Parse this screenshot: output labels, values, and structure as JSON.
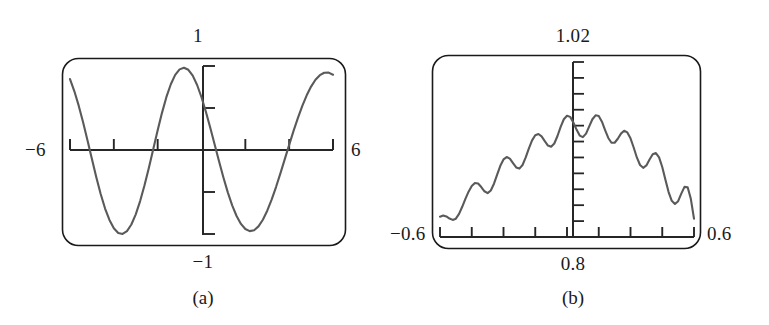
{
  "figure": {
    "kind": "graphing-calculator-screens",
    "ink_color": "#262626",
    "curve_color": "#5a5a5a",
    "frame_color": "#1a1a1a",
    "background": "#ffffff"
  },
  "panels": [
    {
      "id": "a",
      "caption": "(a)",
      "labels": {
        "top": "1",
        "bottom": "−1",
        "left": "−6",
        "right": "6"
      }
    },
    {
      "id": "b",
      "caption": "(b)",
      "labels": {
        "top": "1.02",
        "bottom": "0.8",
        "left": "−0.6",
        "right": "0.6"
      }
    }
  ],
  "chart_data": [
    {
      "type": "line",
      "id": "a",
      "title": "",
      "subtitle": "",
      "xlabel": "",
      "ylabel": "",
      "caption": "(a)",
      "xlim": [
        -6,
        6
      ],
      "ylim": [
        -1,
        1
      ],
      "xticks": [
        -6,
        -4,
        -2,
        0,
        2,
        4,
        6
      ],
      "yticks": [
        -1,
        -0.5,
        0,
        0.5,
        1
      ],
      "xtick_labels": [
        "−6",
        "",
        "",
        "",
        "",
        "",
        "6"
      ],
      "ytick_labels": [
        "−1",
        "",
        "",
        "",
        "1"
      ],
      "grid": false,
      "legend": "none",
      "axes_style": "calculator-crosshair",
      "series": [
        {
          "name": "y = cos(2x)",
          "x": [
            -6.0,
            -5.8,
            -5.6,
            -5.4,
            -5.2,
            -5.0,
            -4.8,
            -4.6,
            -4.4,
            -4.2,
            -4.0,
            -3.8,
            -3.6,
            -3.4,
            -3.2,
            -3.0,
            -2.8,
            -2.6,
            -2.4,
            -2.2,
            -2.0,
            -1.8,
            -1.6,
            -1.4,
            -1.2,
            -1.0,
            -0.8,
            -0.6,
            -0.4,
            -0.2,
            0.0,
            0.2,
            0.4,
            0.6,
            0.8,
            1.0,
            1.2,
            1.4,
            1.6,
            1.8,
            2.0,
            2.2,
            2.4,
            2.6,
            2.8,
            3.0,
            3.2,
            3.4,
            3.6,
            3.8,
            4.0,
            4.2,
            4.4,
            4.6,
            4.8,
            5.0,
            5.2,
            5.4,
            5.6,
            5.8,
            6.0
          ],
          "y": [
            0.844,
            0.699,
            0.525,
            0.327,
            0.113,
            -0.108,
            -0.323,
            -0.523,
            -0.697,
            -0.833,
            -0.932,
            -0.988,
            -0.999,
            -0.965,
            -0.887,
            -0.766,
            -0.608,
            -0.42,
            -0.21,
            0.012,
            0.235,
            0.445,
            0.632,
            0.783,
            0.894,
            0.96,
            0.98,
            0.955,
            0.885,
            0.774,
            0.628,
            0.455,
            0.265,
            0.066,
            -0.134,
            -0.327,
            -0.504,
            -0.659,
            -0.786,
            -0.88,
            -0.941,
            -0.966,
            -0.955,
            -0.909,
            -0.83,
            -0.723,
            -0.591,
            -0.441,
            -0.278,
            -0.109,
            0.061,
            0.227,
            0.383,
            0.526,
            0.651,
            0.755,
            0.836,
            0.891,
            0.92,
            0.921,
            0.896
          ]
        }
      ]
    },
    {
      "type": "line",
      "id": "b",
      "title": "",
      "subtitle": "",
      "xlabel": "",
      "ylabel": "",
      "caption": "(b)",
      "xlim": [
        -0.6,
        0.6
      ],
      "ylim": [
        0.8,
        1.02
      ],
      "xticks": [
        -0.6,
        -0.45,
        -0.3,
        -0.15,
        0,
        0.15,
        0.3,
        0.45,
        0.6
      ],
      "yticks": [
        0.8,
        0.82,
        0.84,
        0.86,
        0.88,
        0.9,
        0.92,
        0.94,
        0.96,
        0.98,
        1.0,
        1.02
      ],
      "xtick_labels": [
        "−0.6",
        "",
        "",
        "",
        "0.8",
        "",
        "",
        "",
        "0.6"
      ],
      "ytick_labels": [
        "0.8",
        "",
        "",
        "",
        "",
        "",
        "",
        "",
        "",
        "",
        "",
        "1.02"
      ],
      "grid": false,
      "legend": "none",
      "axes_style": "calculator-bottom-axis-with-vertical-ticks",
      "series": [
        {
          "name": "windowed oscillation",
          "x": [
            -0.6,
            -0.585,
            -0.57,
            -0.555,
            -0.54,
            -0.525,
            -0.51,
            -0.495,
            -0.48,
            -0.465,
            -0.45,
            -0.435,
            -0.42,
            -0.405,
            -0.39,
            -0.375,
            -0.36,
            -0.345,
            -0.33,
            -0.315,
            -0.3,
            -0.285,
            -0.27,
            -0.255,
            -0.24,
            -0.225,
            -0.21,
            -0.195,
            -0.18,
            -0.165,
            -0.15,
            -0.135,
            -0.12,
            -0.105,
            -0.09,
            -0.075,
            -0.06,
            -0.045,
            -0.03,
            -0.015,
            0.0,
            0.015,
            0.03,
            0.045,
            0.06,
            0.075,
            0.09,
            0.105,
            0.12,
            0.135,
            0.15,
            0.165,
            0.18,
            0.195,
            0.21,
            0.225,
            0.24,
            0.255,
            0.27,
            0.285,
            0.3,
            0.315,
            0.33,
            0.345,
            0.36,
            0.375,
            0.39,
            0.405,
            0.42,
            0.435,
            0.45,
            0.465,
            0.48,
            0.495,
            0.51,
            0.525,
            0.54,
            0.555,
            0.57,
            0.585,
            0.6
          ],
          "y": [
            0.8255,
            0.827,
            0.8258,
            0.8232,
            0.8215,
            0.823,
            0.829,
            0.838,
            0.848,
            0.857,
            0.864,
            0.8678,
            0.8672,
            0.8628,
            0.8575,
            0.8552,
            0.8585,
            0.867,
            0.8785,
            0.8895,
            0.8975,
            0.9005,
            0.8985,
            0.893,
            0.8875,
            0.886,
            0.8905,
            0.9,
            0.9115,
            0.9215,
            0.928,
            0.9295,
            0.9265,
            0.9205,
            0.915,
            0.9135,
            0.9175,
            0.927,
            0.9385,
            0.948,
            0.9525,
            0.951,
            0.944,
            0.935,
            0.9275,
            0.9255,
            0.93,
            0.939,
            0.948,
            0.953,
            0.952,
            0.945,
            0.9345,
            0.9245,
            0.9185,
            0.9185,
            0.9235,
            0.93,
            0.9335,
            0.9315,
            0.924,
            0.9125,
            0.9,
            0.8905,
            0.887,
            0.89,
            0.8975,
            0.904,
            0.9055,
            0.9,
            0.888,
            0.872,
            0.8565,
            0.8455,
            0.8415,
            0.845,
            0.8545,
            0.863,
            0.8625,
            0.848,
            0.823
          ]
        }
      ]
    }
  ]
}
